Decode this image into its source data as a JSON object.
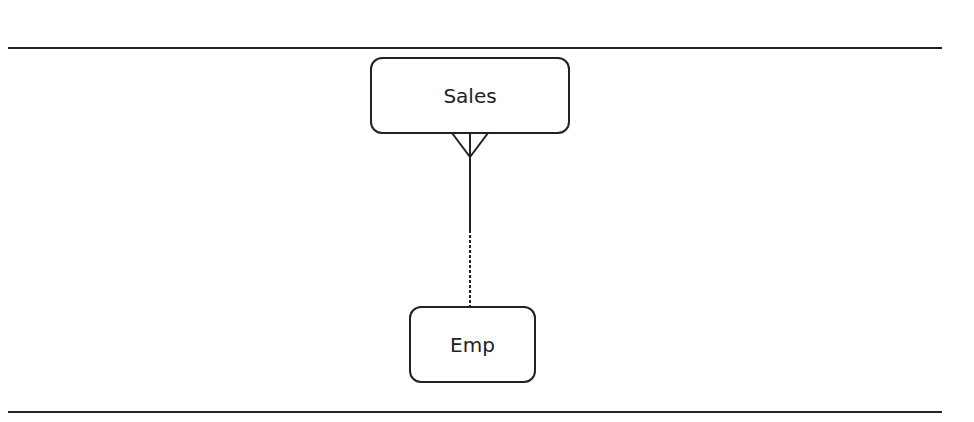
{
  "diagram": {
    "type": "entity-relationship",
    "entities": [
      {
        "id": "sales",
        "label": "Sales"
      },
      {
        "id": "emp",
        "label": "Emp"
      }
    ],
    "relationships": [
      {
        "from": "sales",
        "to": "emp",
        "from_cardinality": "many (crow's foot)",
        "to_cardinality": "one",
        "line_style": "solid near Sales, dashed near Emp"
      }
    ]
  }
}
